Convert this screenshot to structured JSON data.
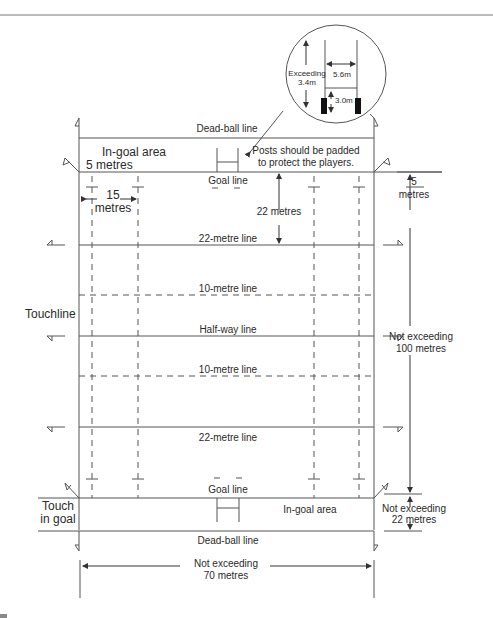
{
  "diagram": {
    "top_rule": true,
    "inset": {
      "height_label_1": "Exceeding",
      "height_label_2": "3.4m",
      "width_label": "5.6m",
      "crossbar_label": "3.0m"
    },
    "callout": {
      "line1": "Posts should be padded",
      "line2": "to protect the players."
    },
    "lines": {
      "dead_ball_top": "Dead-ball line",
      "in_goal_top": "In-goal area",
      "five_metres_top": "5 metres",
      "goal_line_top": "Goal line",
      "fifteen_num": "15",
      "fifteen_unit": "metres",
      "twenty_two_metres": "22 metres",
      "twenty_two_line_top": "22-metre line",
      "ten_line_top": "10-metre line",
      "half_way": "Half-way line",
      "ten_line_bottom": "10-metre line",
      "twenty_two_line_bottom": "22-metre line",
      "goal_line_bottom": "Goal line",
      "in_goal_bottom": "In-goal area",
      "dead_ball_bottom": "Dead-ball line"
    },
    "side_labels": {
      "touchline": "Touchline",
      "touch_in_goal_1": "Touch",
      "touch_in_goal_2": "in goal",
      "five_right_num": "5",
      "five_right_unit": "metres",
      "length_1": "Not exceeding",
      "length_2": "100 metres",
      "ingoal_depth_1": "Not exceeding",
      "ingoal_depth_2": "22 metres",
      "width_1": "Not exceeding",
      "width_2": "70 metres"
    },
    "colors": {
      "line": "#555555",
      "text": "#2a2a2a",
      "post": "#111111"
    }
  }
}
